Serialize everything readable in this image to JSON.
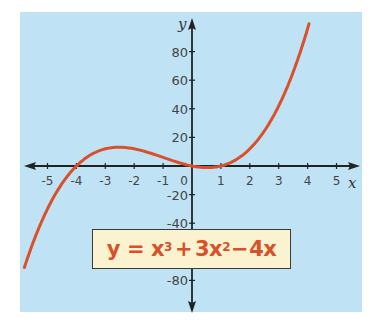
{
  "chart_data": {
    "type": "line",
    "title": "",
    "equation": "y = x³ + 3x² − 4x",
    "equation_parts": {
      "lhs": "y",
      "eq": "=",
      "t1": "x",
      "e1": "3",
      "plus": "+",
      "t2": "3x",
      "e2": "2",
      "minus": "−",
      "t3": "4x"
    },
    "xlabel": "x",
    "ylabel": "y",
    "xlim": [
      -5.8,
      5.7
    ],
    "ylim": [
      -95,
      100
    ],
    "x_ticks": [
      -5,
      -4,
      -3,
      -2,
      -1,
      0,
      1,
      2,
      3,
      4,
      5
    ],
    "x_tick_labels": [
      "-5",
      "-4",
      "-3",
      "-2",
      "-1",
      "0",
      "1",
      "2",
      "3",
      "4",
      "5"
    ],
    "y_ticks": [
      80,
      60,
      40,
      20,
      -20,
      -40,
      -80
    ],
    "y_tick_labels": [
      "80",
      "60",
      "40",
      "20",
      "-20",
      "-40",
      "-80"
    ],
    "grid": false,
    "series": [
      {
        "name": "y = x^3 + 3x^2 - 4x",
        "color": "#d9502a",
        "x": [
          -5.8,
          -5,
          -4,
          -3,
          -2.5,
          -2,
          -1,
          0,
          0.5,
          1,
          2,
          3,
          4,
          4.05
        ],
        "y": [
          -71.2,
          -30,
          0,
          12,
          13.1,
          12,
          6,
          0,
          -1.1,
          0,
          12,
          42,
          96,
          99
        ]
      }
    ],
    "roots": [
      -4,
      0,
      1
    ]
  },
  "colors": {
    "panel_bg": "#bfe3f4",
    "curve": "#d9502a",
    "axis": "#222222",
    "eq_box_bg": "#fbf3d0",
    "eq_text": "#d9502a"
  }
}
